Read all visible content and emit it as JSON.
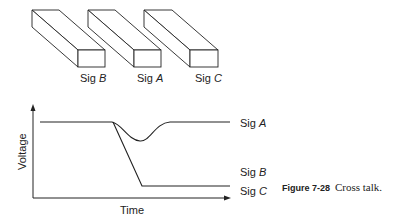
{
  "traces": [
    {
      "name": "Sig A",
      "prefix": "Sig",
      "letter": "A"
    },
    {
      "name": "Sig B",
      "prefix": "Sig",
      "letter": "B"
    },
    {
      "name": "Sig C",
      "prefix": "Sig",
      "letter": "C"
    }
  ],
  "axes": {
    "ylabel": "Voltage",
    "xlabel": "Time"
  },
  "caption": {
    "number": "Figure 7-28",
    "text": "Cross talk."
  },
  "colors": {
    "line": "#222222",
    "background": "#ffffff"
  }
}
